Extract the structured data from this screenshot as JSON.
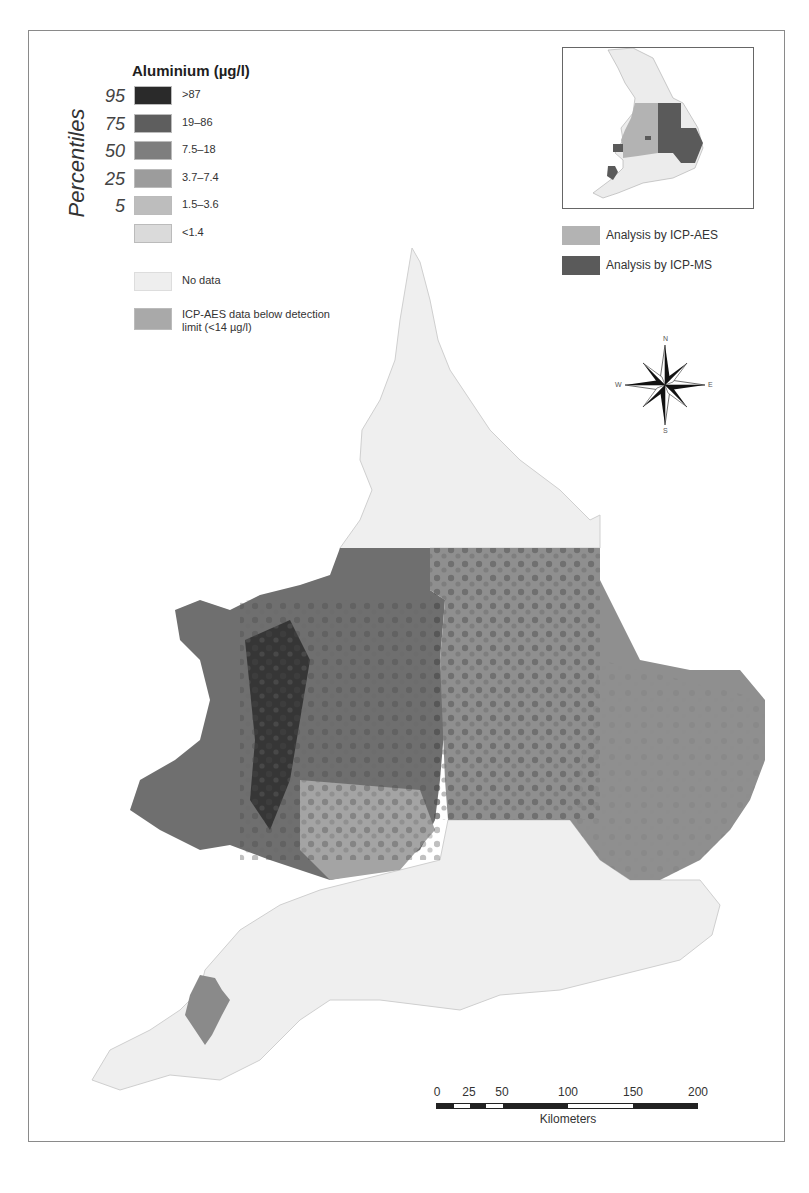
{
  "map": {
    "title": "Aluminium (µg/l)",
    "region": "England and Wales",
    "legend": {
      "axis_label": "Percentiles",
      "percentile_ticks": [
        "95",
        "75",
        "50",
        "25",
        "5"
      ],
      "classes": [
        {
          "label": ">87",
          "color": "#2a2a2a"
        },
        {
          "label": "19–86",
          "color": "#5e5e5e"
        },
        {
          "label": "7.5–18",
          "color": "#7e7e7e"
        },
        {
          "label": "3.7–7.4",
          "color": "#9c9c9c"
        },
        {
          "label": "1.5–3.6",
          "color": "#bdbdbd"
        },
        {
          "label": "<1.4",
          "color": "#dadada"
        }
      ],
      "extra": [
        {
          "label": "No data",
          "color": "#eeeeee"
        },
        {
          "label": "ICP-AES data below detection limit (<14 µg/l)",
          "color": "#a9a9a9"
        }
      ]
    },
    "inset": {
      "legend": [
        {
          "label": "Analysis by ICP-AES",
          "color": "#b3b3b3"
        },
        {
          "label": "Analysis by ICP-MS",
          "color": "#5a5a5a"
        }
      ]
    },
    "compass": {
      "n": "N",
      "s": "S",
      "e": "E",
      "w": "W"
    },
    "scalebar": {
      "ticks": [
        "0",
        "25",
        "50",
        "100",
        "150",
        "200"
      ],
      "unit": "Kilometers"
    }
  }
}
